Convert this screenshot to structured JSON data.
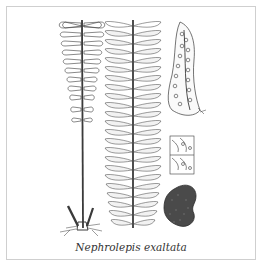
{
  "caption": "Nephrolepis exaltata",
  "colors": {
    "ink": "#3a3a3a",
    "frame": "#cfcfcf",
    "background": "#ffffff"
  },
  "panels": [
    {
      "name": "frond-outline",
      "description": "Frond with outlined pinnae and long stipe with rhizome base"
    },
    {
      "name": "frond-detailed",
      "description": "Shaded frond with many pinnae along central rachis"
    },
    {
      "name": "pinna-sori",
      "description": "Single pinna showing rows of round sori"
    },
    {
      "name": "sori-detail",
      "description": "Magnified detail of sori on pinna segments"
    },
    {
      "name": "sorus-scale",
      "description": "Dark textured rounded scale / sorus cluster"
    }
  ]
}
